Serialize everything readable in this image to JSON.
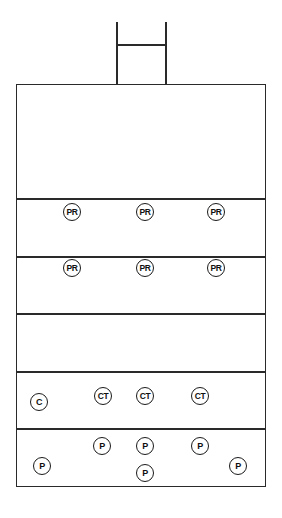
{
  "diagram": {
    "tower": {
      "left_x": 117,
      "right_x": 166,
      "top_y": 22,
      "bar_y": 44,
      "base_y": 84
    },
    "outer_box": {
      "left": 16,
      "top": 84,
      "right": 265,
      "bottom": 486
    },
    "dividers_y": [
      199,
      256,
      314,
      371,
      429
    ],
    "markers": [
      {
        "label": "PR",
        "x": 72,
        "y": 212
      },
      {
        "label": "PR",
        "x": 145,
        "y": 212
      },
      {
        "label": "PR",
        "x": 216,
        "y": 212
      },
      {
        "label": "PR",
        "x": 72,
        "y": 268
      },
      {
        "label": "PR",
        "x": 145,
        "y": 268
      },
      {
        "label": "PR",
        "x": 216,
        "y": 268
      },
      {
        "label": "C",
        "x": 39,
        "y": 402
      },
      {
        "label": "CT",
        "x": 103,
        "y": 396
      },
      {
        "label": "CT",
        "x": 145,
        "y": 396
      },
      {
        "label": "CT",
        "x": 200,
        "y": 396
      },
      {
        "label": "P",
        "x": 102,
        "y": 446
      },
      {
        "label": "P",
        "x": 145,
        "y": 446
      },
      {
        "label": "P",
        "x": 200,
        "y": 446
      },
      {
        "label": "P",
        "x": 42,
        "y": 466
      },
      {
        "label": "P",
        "x": 238,
        "y": 466
      },
      {
        "label": "P",
        "x": 145,
        "y": 473
      }
    ]
  }
}
